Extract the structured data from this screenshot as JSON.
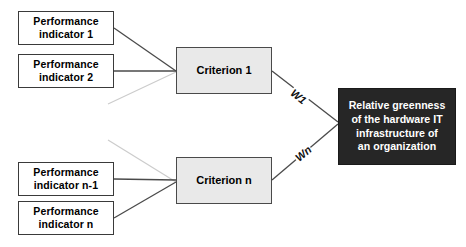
{
  "diagram": {
    "background_color": "#ffffff",
    "nodes": {
      "indicator_1": {
        "label": "Performance indicator 1",
        "line1": "Performance",
        "line2": "indicator 1",
        "fill": "#ffffff",
        "border": "#3a3a3a"
      },
      "indicator_2": {
        "label": "Performance indicator 2",
        "line1": "Performance",
        "line2": "indicator 2",
        "fill": "#ffffff",
        "border": "#3a3a3a"
      },
      "indicator_n_minus_1": {
        "label": "Performance indicator n-1",
        "line1": "Performance",
        "line2": "indicator n-1",
        "fill": "#ffffff",
        "border": "#3a3a3a"
      },
      "indicator_n": {
        "label": "Performance indicator n",
        "line1": "Performance",
        "line2": "indicator n",
        "fill": "#ffffff",
        "border": "#3a3a3a"
      },
      "criterion_1": {
        "label": "Criterion 1",
        "fill": "#e9e9e9",
        "border": "#4a4a4a"
      },
      "criterion_n": {
        "label": "Criterion n",
        "fill": "#e9e9e9",
        "border": "#4a4a4a"
      },
      "goal": {
        "label": "Relative greenness of the hardware IT infrastructure of an organization",
        "line1": "Relative greenness",
        "line2": "of the hardware IT",
        "line3": "infrastructure of",
        "line4": "an organization",
        "fill": "#262626",
        "text_color": "#ffffff"
      }
    },
    "edge_labels": {
      "w1": "W1",
      "wn": "Wn"
    },
    "edge_colors": {
      "solid": "#4a4a4a",
      "faint": "#c9c9c9"
    }
  }
}
